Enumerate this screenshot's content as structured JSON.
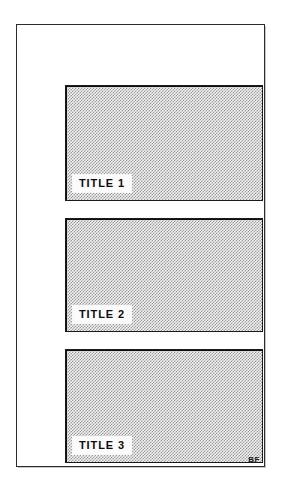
{
  "figure": {
    "background_color": "#ffffff",
    "frame": {
      "name": "outer-border",
      "color": "#2b2b2b"
    },
    "corner_mark": "BF",
    "panels": [
      {
        "label": "TITLE 1",
        "fill": "dither-halftone",
        "border_color": "#1a1a1a"
      },
      {
        "label": "TITLE 2",
        "fill": "dither-halftone",
        "border_color": "#1a1a1a"
      },
      {
        "label": "TITLE 3",
        "fill": "dither-halftone",
        "border_color": "#1a1a1a"
      }
    ]
  }
}
